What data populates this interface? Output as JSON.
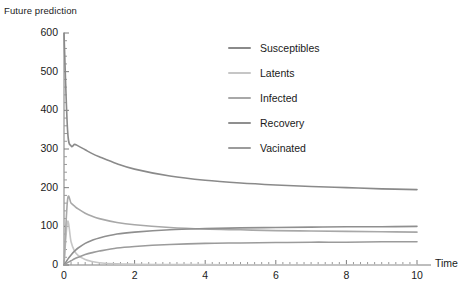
{
  "chart_data": {
    "type": "line",
    "title": "Future prediction",
    "xlabel": "Time",
    "ylabel": "",
    "xlim": [
      0,
      10
    ],
    "ylim": [
      0,
      600
    ],
    "xticks": [
      "0",
      "2",
      "4",
      "6",
      "8",
      "10"
    ],
    "xtick_values": [
      0,
      2,
      4,
      6,
      8,
      10
    ],
    "yticks": [
      "0",
      "100",
      "200",
      "300",
      "400",
      "500",
      "600"
    ],
    "ytick_values": [
      0,
      100,
      200,
      300,
      400,
      500,
      600
    ],
    "grid": false,
    "minor_ticks": true,
    "legend_position": "upper-right-inside",
    "x": [
      0,
      0.1,
      0.2,
      0.3,
      0.4,
      0.6,
      0.8,
      1,
      1.5,
      2,
      3,
      4,
      5,
      6,
      7,
      8,
      9,
      10
    ],
    "series": [
      {
        "name": "Susceptibles",
        "color": "#8a8a8a",
        "values": [
          600,
          350,
          308,
          312,
          308,
          298,
          288,
          280,
          262,
          248,
          230,
          219,
          212,
          207,
          203,
          200,
          197,
          195
        ]
      },
      {
        "name": "Latents",
        "color": "#c6c6c6",
        "values": [
          0,
          112,
          60,
          36,
          25,
          14,
          9,
          6,
          3,
          2,
          1,
          1,
          0,
          0,
          0,
          0,
          0,
          0
        ]
      },
      {
        "name": "Infected",
        "color": "#a8a8a8",
        "values": [
          0,
          168,
          160,
          152,
          145,
          134,
          126,
          120,
          110,
          104,
          97,
          93,
          91,
          89,
          88,
          87,
          86,
          85
        ]
      },
      {
        "name": "Recovery",
        "color": "#8f8f8f",
        "values": [
          0,
          14,
          26,
          36,
          44,
          56,
          64,
          70,
          80,
          85,
          91,
          94,
          96,
          97,
          98,
          99,
          99,
          100
        ]
      },
      {
        "name": "Vacinated",
        "color": "#9b9b9b",
        "values": [
          0,
          6,
          11,
          16,
          20,
          27,
          32,
          36,
          44,
          48,
          53,
          56,
          57,
          58,
          59,
          59,
          60,
          60
        ]
      }
    ]
  }
}
